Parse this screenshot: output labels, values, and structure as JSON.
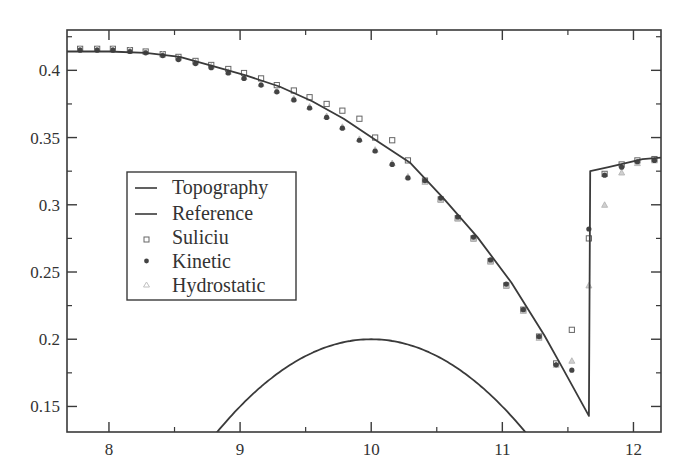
{
  "chart_data": {
    "type": "line",
    "title": "",
    "xlabel": "",
    "ylabel": "",
    "xlim": [
      7.68,
      12.21
    ],
    "ylim": [
      0.131,
      0.43
    ],
    "grid": false,
    "legend_position": "center-left (inside plot)",
    "x_ticks": [
      8,
      9,
      10,
      11,
      12
    ],
    "x_tick_labels": [
      "8",
      "9",
      "10",
      "11",
      "12"
    ],
    "x_minor_ticks": [
      8.5,
      9.5,
      10.5,
      11.5
    ],
    "y_ticks": [
      0.15,
      0.2,
      0.25,
      0.3,
      0.35,
      0.4
    ],
    "y_tick_labels": [
      "0.15",
      "0.2",
      "0.25",
      "0.3",
      "0.35",
      "0.4"
    ],
    "y_minor_ticks": [
      0.175,
      0.225,
      0.275,
      0.325,
      0.375,
      0.425
    ],
    "legend": [
      "Topography",
      "Reference",
      "Suliciu",
      "Kinetic",
      "Hydrostatic"
    ],
    "series": [
      {
        "name": "Topography",
        "style": "line",
        "note": "parabolic bump z = 0.2 - 0.05(x-10)^2, clipped by axis",
        "x": [
          8.83,
          9.0,
          9.2,
          9.4,
          9.6,
          9.8,
          10.0,
          10.2,
          10.4,
          10.6,
          10.8,
          11.0,
          11.16
        ],
        "y": [
          0.131,
          0.15,
          0.168,
          0.182,
          0.192,
          0.198,
          0.2,
          0.198,
          0.192,
          0.182,
          0.168,
          0.15,
          0.133
        ]
      },
      {
        "name": "Reference",
        "style": "line",
        "x": [
          7.68,
          8.0,
          8.28,
          8.54,
          8.8,
          9.05,
          9.3,
          9.55,
          9.79,
          10.05,
          10.3,
          10.55,
          10.81,
          11.07,
          11.32,
          11.44,
          11.66,
          11.67,
          11.81,
          11.94,
          12.07,
          12.21
        ],
        "y": [
          0.414,
          0.414,
          0.413,
          0.41,
          0.403,
          0.396,
          0.388,
          0.377,
          0.364,
          0.347,
          0.331,
          0.305,
          0.276,
          0.242,
          0.203,
          0.182,
          0.143,
          0.325,
          0.328,
          0.331,
          0.334,
          0.335
        ]
      },
      {
        "name": "Suliciu",
        "style": "open-square",
        "x": [
          7.78,
          7.91,
          8.03,
          8.16,
          8.28,
          8.41,
          8.53,
          8.66,
          8.78,
          8.91,
          9.03,
          9.16,
          9.28,
          9.41,
          9.53,
          9.66,
          9.78,
          9.91,
          10.03,
          10.16,
          10.28,
          10.41,
          10.53,
          10.66,
          10.78,
          10.91,
          11.03,
          11.16,
          11.28,
          11.41,
          11.53,
          11.66,
          11.78,
          11.91,
          12.03,
          12.16
        ],
        "y": [
          0.416,
          0.416,
          0.416,
          0.415,
          0.414,
          0.412,
          0.41,
          0.407,
          0.404,
          0.401,
          0.398,
          0.394,
          0.389,
          0.385,
          0.38,
          0.375,
          0.37,
          0.364,
          0.35,
          0.348,
          0.333,
          0.318,
          0.304,
          0.29,
          0.275,
          0.258,
          0.24,
          0.222,
          0.202,
          0.182,
          0.207,
          0.275,
          0.323,
          0.33,
          0.333,
          0.334
        ]
      },
      {
        "name": "Kinetic",
        "style": "filled-circle",
        "x": [
          7.78,
          7.91,
          8.03,
          8.16,
          8.28,
          8.41,
          8.53,
          8.66,
          8.78,
          8.91,
          9.03,
          9.16,
          9.28,
          9.41,
          9.53,
          9.66,
          9.78,
          9.91,
          10.03,
          10.16,
          10.28,
          10.41,
          10.53,
          10.66,
          10.78,
          10.91,
          11.03,
          11.16,
          11.28,
          11.41,
          11.53,
          11.66,
          11.78,
          11.91,
          12.03,
          12.16
        ],
        "y": [
          0.415,
          0.415,
          0.415,
          0.414,
          0.413,
          0.411,
          0.408,
          0.405,
          0.402,
          0.398,
          0.394,
          0.389,
          0.384,
          0.378,
          0.372,
          0.365,
          0.357,
          0.348,
          0.34,
          0.33,
          0.32,
          0.318,
          0.305,
          0.291,
          0.276,
          0.259,
          0.241,
          0.222,
          0.202,
          0.181,
          0.177,
          0.282,
          0.322,
          0.328,
          0.332,
          0.333
        ]
      },
      {
        "name": "Hydrostatic",
        "style": "open-triangle",
        "x": [
          7.78,
          7.91,
          8.03,
          8.16,
          8.28,
          8.41,
          8.53,
          8.66,
          8.78,
          8.91,
          9.03,
          9.16,
          9.28,
          9.41,
          9.53,
          9.66,
          9.78,
          9.91,
          10.03,
          10.16,
          10.28,
          10.41,
          10.53,
          10.66,
          10.78,
          10.91,
          11.03,
          11.16,
          11.28,
          11.41,
          11.53,
          11.66,
          11.78,
          11.91,
          12.03,
          12.16
        ],
        "y": [
          0.416,
          0.416,
          0.416,
          0.415,
          0.414,
          0.412,
          0.409,
          0.406,
          0.403,
          0.399,
          0.395,
          0.39,
          0.385,
          0.379,
          0.373,
          0.366,
          0.358,
          0.349,
          0.341,
          0.331,
          0.321,
          0.317,
          0.304,
          0.29,
          0.275,
          0.258,
          0.24,
          0.221,
          0.201,
          0.181,
          0.184,
          0.24,
          0.3,
          0.324,
          0.331,
          0.333
        ]
      }
    ]
  },
  "colors": {
    "line": "#3a3a3a",
    "marker_square": "#666666",
    "marker_circle": "#444444",
    "marker_triangle": "#b0b0b0",
    "frame": "#3a3a3a"
  }
}
